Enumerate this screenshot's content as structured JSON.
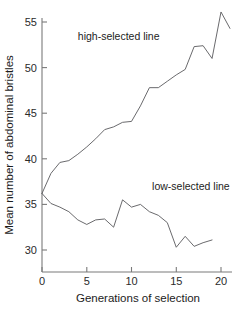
{
  "chart_data": {
    "type": "line",
    "title": "",
    "xlabel": "Generations of selection",
    "ylabel": "Mean number of abdominal bristles",
    "xlim": [
      0,
      20
    ],
    "ylim": [
      27.5,
      56.8
    ],
    "xticks": [
      0,
      5,
      10,
      15,
      20
    ],
    "yticks": [
      30,
      35,
      40,
      45,
      50,
      55
    ],
    "xtick_labels": [
      "0",
      "5",
      "10",
      "15",
      "20"
    ],
    "ytick_labels": [
      "30",
      "35",
      "40",
      "45",
      "50",
      "55"
    ],
    "grid": false,
    "legend_position": "inline-annotations",
    "line_color": "#59595c",
    "axis_color": "#7a7a7a",
    "x": [
      0,
      1,
      2,
      3,
      4,
      5,
      6,
      7,
      8,
      9,
      10,
      11,
      12,
      13,
      14,
      15,
      16,
      17,
      18,
      19,
      20,
      21
    ],
    "series": [
      {
        "name": "high-selected line",
        "label": "high-selected line",
        "x": [
          0,
          1,
          2,
          3,
          4,
          5,
          6,
          7,
          8,
          9,
          10,
          11,
          12,
          13,
          14,
          15,
          16,
          17,
          18,
          19,
          20,
          21
        ],
        "values": [
          36.2,
          38.4,
          39.6,
          39.8,
          40.5,
          41.3,
          42.2,
          43.2,
          43.5,
          44.0,
          44.1,
          45.8,
          47.8,
          47.8,
          48.5,
          49.2,
          49.8,
          52.3,
          52.4,
          51.0,
          56.1,
          54.3
        ],
        "annotation": {
          "text": "high-selected line",
          "x": 4.0,
          "y": 53.0
        }
      },
      {
        "name": "low-selected line",
        "label": "low-selected line",
        "x": [
          0,
          1,
          2,
          3,
          4,
          5,
          6,
          7,
          8,
          9,
          10,
          11,
          12,
          13,
          14,
          15,
          16,
          17,
          18,
          19
        ],
        "values": [
          36.2,
          35.1,
          34.7,
          34.2,
          33.3,
          32.8,
          33.3,
          33.4,
          32.5,
          35.5,
          34.7,
          35.0,
          34.2,
          33.8,
          33.0,
          30.3,
          31.5,
          30.4,
          30.8,
          31.1
        ],
        "annotation": {
          "text": "low-selected line",
          "x": 12.3,
          "y": 36.6
        }
      }
    ]
  },
  "axes": {
    "x_title": "Generations of selection",
    "y_title": "Mean number of abdominal bristles"
  },
  "ticks": {
    "y": [
      "55",
      "50",
      "45",
      "40",
      "35",
      "30"
    ],
    "x": [
      "0",
      "5",
      "10",
      "15",
      "20"
    ]
  },
  "annotations": {
    "high": "high-selected line",
    "low": "low-selected line"
  }
}
